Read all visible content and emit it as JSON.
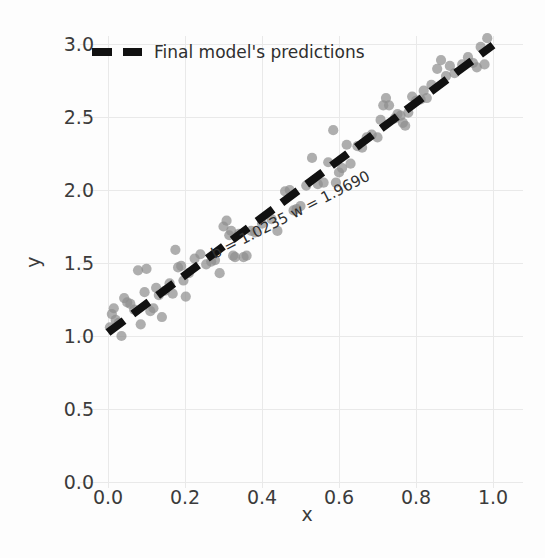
{
  "chart_data": {
    "type": "scatter",
    "title": "",
    "xlabel": "x",
    "ylabel": "y",
    "xlim": [
      -0.03,
      1.04
    ],
    "ylim": [
      0.0,
      3.1
    ],
    "xticks": [
      "0.0",
      "0.2",
      "0.4",
      "0.6",
      "0.8",
      "1.0"
    ],
    "xtick_values": [
      0.0,
      0.2,
      0.4,
      0.6,
      0.8,
      1.0
    ],
    "yticks": [
      "0.0",
      "0.5",
      "1.0",
      "1.5",
      "2.0",
      "2.5",
      "3.0"
    ],
    "ytick_values": [
      0.0,
      0.5,
      1.0,
      1.5,
      2.0,
      2.5,
      3.0
    ],
    "grid": true,
    "legend_position": "upper left",
    "legend": [
      {
        "label": "Final model's predictions",
        "style": "dashed-line",
        "color": "#111111"
      }
    ],
    "annotations": [
      {
        "text": "b = 1.0235 w = 1.9690",
        "x": 0.48,
        "y": 1.8,
        "rotation": -27
      }
    ],
    "fit_line": {
      "name": "Final model's predictions",
      "intercept": 1.0235,
      "slope": 1.969,
      "x_start": 0.0,
      "x_end": 1.0,
      "color": "#111111",
      "dash": "dashed"
    },
    "series": [
      {
        "name": "samples",
        "type": "scatter",
        "color": "#8f8f8f",
        "opacity": 0.72,
        "points": [
          [
            0.005,
            1.06
          ],
          [
            0.01,
            1.15
          ],
          [
            0.015,
            1.19
          ],
          [
            0.02,
            1.11
          ],
          [
            0.028,
            1.09
          ],
          [
            0.035,
            1.0
          ],
          [
            0.042,
            1.26
          ],
          [
            0.05,
            1.23
          ],
          [
            0.058,
            1.22
          ],
          [
            0.068,
            1.18
          ],
          [
            0.078,
            1.45
          ],
          [
            0.085,
            1.08
          ],
          [
            0.095,
            1.3
          ],
          [
            0.1,
            1.46
          ],
          [
            0.11,
            1.17
          ],
          [
            0.118,
            1.19
          ],
          [
            0.125,
            1.33
          ],
          [
            0.132,
            1.28
          ],
          [
            0.14,
            1.13
          ],
          [
            0.148,
            1.31
          ],
          [
            0.16,
            1.36
          ],
          [
            0.168,
            1.29
          ],
          [
            0.175,
            1.59
          ],
          [
            0.182,
            1.47
          ],
          [
            0.19,
            1.48
          ],
          [
            0.196,
            1.38
          ],
          [
            0.202,
            1.27
          ],
          [
            0.21,
            1.43
          ],
          [
            0.225,
            1.53
          ],
          [
            0.24,
            1.56
          ],
          [
            0.255,
            1.49
          ],
          [
            0.268,
            1.51
          ],
          [
            0.278,
            1.52
          ],
          [
            0.29,
            1.43
          ],
          [
            0.3,
            1.75
          ],
          [
            0.308,
            1.79
          ],
          [
            0.315,
            1.69
          ],
          [
            0.32,
            1.72
          ],
          [
            0.325,
            1.55
          ],
          [
            0.33,
            1.54
          ],
          [
            0.34,
            1.7
          ],
          [
            0.352,
            1.54
          ],
          [
            0.36,
            1.55
          ],
          [
            0.372,
            1.72
          ],
          [
            0.382,
            1.71
          ],
          [
            0.4,
            1.77
          ],
          [
            0.425,
            1.8
          ],
          [
            0.44,
            1.72
          ],
          [
            0.46,
            1.99
          ],
          [
            0.472,
            2.0
          ],
          [
            0.482,
            1.86
          ],
          [
            0.49,
            1.87
          ],
          [
            0.5,
            1.89
          ],
          [
            0.515,
            2.03
          ],
          [
            0.53,
            2.22
          ],
          [
            0.545,
            2.04
          ],
          [
            0.56,
            2.05
          ],
          [
            0.572,
            2.19
          ],
          [
            0.585,
            2.41
          ],
          [
            0.592,
            2.05
          ],
          [
            0.6,
            2.12
          ],
          [
            0.608,
            2.15
          ],
          [
            0.62,
            2.31
          ],
          [
            0.63,
            2.18
          ],
          [
            0.648,
            2.3
          ],
          [
            0.66,
            2.29
          ],
          [
            0.672,
            2.36
          ],
          [
            0.685,
            2.38
          ],
          [
            0.7,
            2.36
          ],
          [
            0.708,
            2.48
          ],
          [
            0.715,
            2.58
          ],
          [
            0.722,
            2.63
          ],
          [
            0.73,
            2.58
          ],
          [
            0.745,
            2.49
          ],
          [
            0.752,
            2.52
          ],
          [
            0.76,
            2.51
          ],
          [
            0.766,
            2.46
          ],
          [
            0.772,
            2.44
          ],
          [
            0.78,
            2.53
          ],
          [
            0.79,
            2.64
          ],
          [
            0.8,
            2.61
          ],
          [
            0.812,
            2.62
          ],
          [
            0.82,
            2.68
          ],
          [
            0.828,
            2.63
          ],
          [
            0.84,
            2.72
          ],
          [
            0.855,
            2.83
          ],
          [
            0.865,
            2.89
          ],
          [
            0.878,
            2.78
          ],
          [
            0.888,
            2.85
          ],
          [
            0.9,
            2.8
          ],
          [
            0.92,
            2.86
          ],
          [
            0.935,
            2.91
          ],
          [
            0.948,
            2.87
          ],
          [
            0.958,
            2.84
          ],
          [
            0.968,
            2.98
          ],
          [
            0.978,
            2.86
          ],
          [
            0.985,
            3.04
          ]
        ]
      }
    ]
  },
  "axes": {
    "y_axis_title": "y",
    "x_axis_title": "x"
  }
}
